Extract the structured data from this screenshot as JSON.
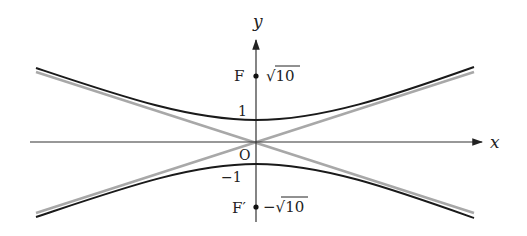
{
  "diagram": {
    "type": "hyperbola",
    "equation": "y^2 - x^2/9 = 1",
    "axes": {
      "x_label": "x",
      "y_label": "y",
      "origin_label": "O"
    },
    "ticks": {
      "y_pos_one": "1",
      "y_neg_one": "−1"
    },
    "foci": {
      "upper": {
        "label": "F",
        "value": "√10"
      },
      "lower": {
        "label": "F′",
        "value": "−√10"
      }
    },
    "colors": {
      "curve": "#1a1a1a",
      "asymptote": "#a8a8a8",
      "axis": "#333333"
    }
  }
}
